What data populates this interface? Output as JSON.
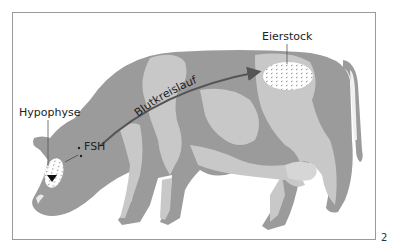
{
  "figure": {
    "labels": {
      "hypophyse": "Hypophyse",
      "fsh": "FSH",
      "blutkreislauf": "Blutkreislauf",
      "eierstock": "Eierstock"
    },
    "figure_number": "2",
    "colors": {
      "dark_patch": "#9b9b9b",
      "light_patch": "#c8c8c8",
      "arrow": "#555555",
      "frame": "#9a9a9a",
      "text": "#222222"
    }
  }
}
